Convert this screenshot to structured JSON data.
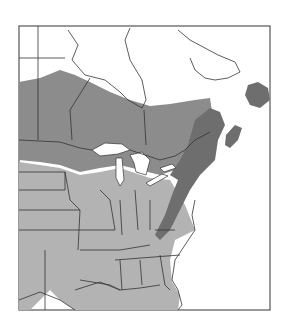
{
  "map": {
    "type": "range-map",
    "region": "Eastern North America",
    "legend": [],
    "colors": {
      "background": "#ffffff",
      "range_light": "#b3b3b3",
      "range_mid": "#8c8c8c",
      "range_dark": "#6e6e6e",
      "borders": "#333333",
      "frame": "#555555"
    }
  }
}
